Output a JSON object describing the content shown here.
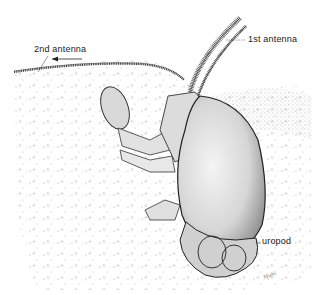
{
  "figure": {
    "labels": {
      "second_antenna": "2nd antenna",
      "first_antenna": "1st antenna",
      "uropod": "uropod"
    },
    "signature": "Mahi"
  }
}
